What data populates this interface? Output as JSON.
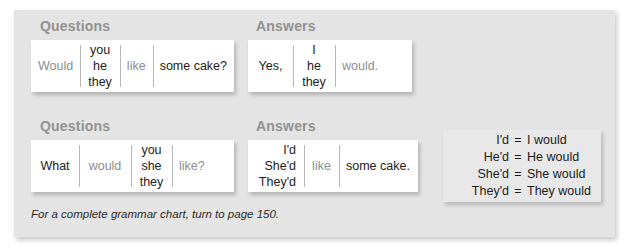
{
  "panel": {
    "background_color": "#e4e4e4",
    "heading_color": "#919191",
    "muted_text_color": "#8d8d8d",
    "text_color": "#1c1c1c",
    "legend_background_color": "#e8e8e8"
  },
  "sections": {
    "questions_1_heading": "Questions",
    "answers_1_heading": "Answers",
    "questions_2_heading": "Questions",
    "answers_2_heading": "Answers"
  },
  "tables": {
    "questions_1": {
      "c0": "Would",
      "c1_l1": "you",
      "c1_l2": "he",
      "c1_l3": "they",
      "c2": "like",
      "c3": "some cake?"
    },
    "answers_1": {
      "c0": "Yes,",
      "c1_l1": "I",
      "c1_l2": "he",
      "c1_l3": "they",
      "c2": "would."
    },
    "questions_2": {
      "c0": "What",
      "c1": "would",
      "c2_l1": "you",
      "c2_l2": "she",
      "c2_l3": "they",
      "c3": "like?"
    },
    "answers_2": {
      "c0_l1": "I'd",
      "c0_l2": "She'd",
      "c0_l3": "They'd",
      "c1": "like",
      "c2": "some cake."
    }
  },
  "legend": {
    "rows": [
      {
        "short": "I'd",
        "eq": "=",
        "long": "I would"
      },
      {
        "short": "He'd",
        "eq": "=",
        "long": "He would"
      },
      {
        "short": "She'd",
        "eq": "=",
        "long": "She would"
      },
      {
        "short": "They'd",
        "eq": "=",
        "long": "They would"
      }
    ]
  },
  "footer": {
    "note": "For a complete grammar chart, turn to page 150."
  }
}
